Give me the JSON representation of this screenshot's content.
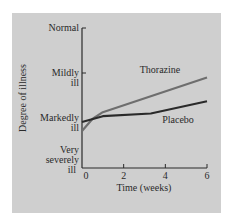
{
  "chart_data": {
    "type": "line",
    "title": "",
    "xlabel": "Time (weeks)",
    "ylabel": "Degree of illness",
    "x_ticks": [
      0,
      2,
      4,
      6
    ],
    "xlim": [
      0,
      6
    ],
    "y_levels": [
      {
        "value": 0,
        "label_lines": [
          "Very",
          "severely",
          "ill"
        ]
      },
      {
        "value": 1,
        "label_lines": [
          "Markedly",
          "ill"
        ]
      },
      {
        "value": 2,
        "label_lines": [
          "Mildly",
          "ill"
        ]
      },
      {
        "value": 3,
        "label_lines": [
          "Normal"
        ]
      }
    ],
    "ylim": [
      0,
      3
    ],
    "grid": false,
    "legend_position": "inline labels",
    "series": [
      {
        "name": "Thorazine",
        "color": "#6e6e6e",
        "x": [
          0,
          0.5,
          1,
          6
        ],
        "y": [
          0.74,
          0.98,
          1.13,
          1.9
        ]
      },
      {
        "name": "Placebo",
        "color": "#2a2a2a",
        "x": [
          0,
          1,
          3.3,
          6
        ],
        "y": [
          0.92,
          1.04,
          1.1,
          1.37
        ]
      }
    ]
  }
}
